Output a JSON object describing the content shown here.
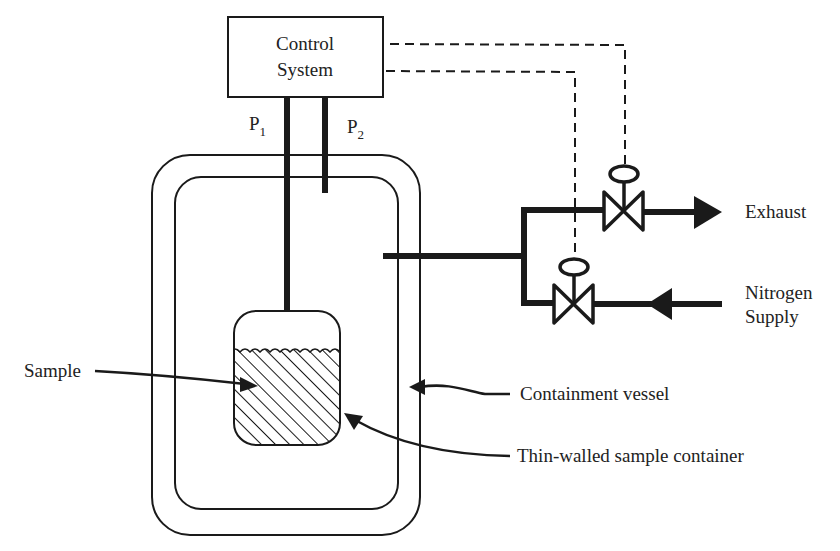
{
  "diagram": {
    "control_system": {
      "line1": "Control",
      "line2": "System"
    },
    "pressure_lines": {
      "p1": {
        "base": "P",
        "subscript": "1"
      },
      "p2": {
        "base": "P",
        "subscript": "2"
      }
    },
    "outlets": {
      "exhaust": "Exhaust",
      "nitrogen_line1": "Nitrogen",
      "nitrogen_line2": "Supply"
    },
    "callouts": {
      "sample": "Sample",
      "containment_vessel": "Containment vessel",
      "sample_container": "Thin-walled sample container"
    },
    "colors": {
      "stroke": "#1a1a1a",
      "background": "#ffffff"
    }
  }
}
